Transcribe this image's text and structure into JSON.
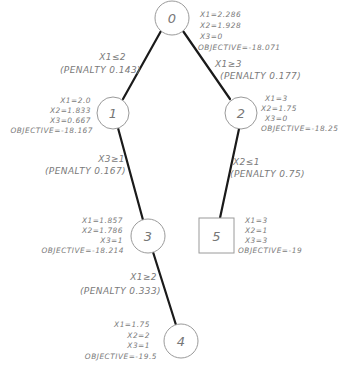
{
  "nodes": [
    {
      "id": "0",
      "shape": "circle",
      "values": {
        "x1": "X1=2.286",
        "x2": "X2=1.928",
        "x3": "X3=0",
        "objective": "OBJECTIVE=-18.071"
      }
    },
    {
      "id": "1",
      "shape": "circle",
      "values": {
        "x1": "X1=2.0",
        "x2": "X2=1.833",
        "x3": "X3=0.667",
        "objective": "OBJECTIVE=-18.167"
      }
    },
    {
      "id": "2",
      "shape": "circle",
      "values": {
        "x1": "X1=3",
        "x2": "X2=1.75",
        "x3": "X3=0",
        "objective": "OBJECTIVE=-18.25"
      }
    },
    {
      "id": "3",
      "shape": "circle",
      "values": {
        "x1": "X1=1.857",
        "x2": "X2=1.786",
        "x3": "X3=1",
        "objective": "OBJECTIVE=-18.214"
      }
    },
    {
      "id": "5",
      "shape": "square",
      "values": {
        "x1": "X1=3",
        "x2": "X2=1",
        "x3": "X3=3",
        "objective": "OBJECTIVE=-19"
      }
    },
    {
      "id": "4",
      "shape": "circle",
      "values": {
        "x1": "X1=1.75",
        "x2": "X2=2",
        "x3": "X3=1",
        "objective": "OBJECTIVE=-19.5"
      }
    }
  ],
  "edges": [
    {
      "from": "0",
      "to": "1",
      "constraint": "X1≤2",
      "penalty": "(PENALTY 0.143)"
    },
    {
      "from": "0",
      "to": "2",
      "constraint": "X1≥3",
      "penalty": "(PENALTY 0.177)"
    },
    {
      "from": "1",
      "to": "3",
      "constraint": "X3≥1",
      "penalty": "(PENALTY 0.167)"
    },
    {
      "from": "2",
      "to": "5",
      "constraint": "X2≤1",
      "penalty": "(PENALTY 0.75)"
    },
    {
      "from": "3",
      "to": "4",
      "constraint": "X1≥2",
      "penalty": "(PENALTY 0.333)"
    }
  ]
}
